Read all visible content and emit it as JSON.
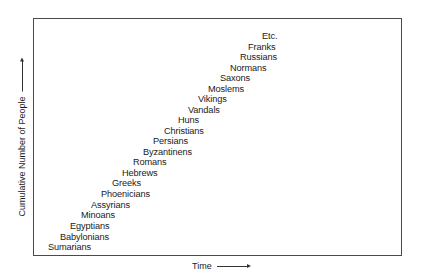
{
  "chart_data": {
    "type": "scatter",
    "title": "",
    "xlabel": "Time",
    "ylabel": "Cumulative Number of People",
    "grid": false,
    "legend": null,
    "axis_ticks": "none",
    "annotations": "Text labels arranged diagonally, each representing a people group; position rises with time",
    "points": [
      {
        "label": "Sumarians",
        "order": 1
      },
      {
        "label": "Babylonians",
        "order": 2
      },
      {
        "label": "Egyptians",
        "order": 3
      },
      {
        "label": "Minoans",
        "order": 4
      },
      {
        "label": "Assyrians",
        "order": 5
      },
      {
        "label": "Phoenicians",
        "order": 6
      },
      {
        "label": "Greeks",
        "order": 7
      },
      {
        "label": "Hebrews",
        "order": 8
      },
      {
        "label": "Romans",
        "order": 9
      },
      {
        "label": "Byzantinens",
        "order": 10
      },
      {
        "label": "Persians",
        "order": 11
      },
      {
        "label": "Christians",
        "order": 12
      },
      {
        "label": "Huns",
        "order": 13
      },
      {
        "label": "Vandals",
        "order": 14
      },
      {
        "label": "Vikings",
        "order": 15
      },
      {
        "label": "Moslems",
        "order": 16
      },
      {
        "label": "Saxons",
        "order": 17
      },
      {
        "label": "Normans",
        "order": 18
      },
      {
        "label": "Russians",
        "order": 19
      },
      {
        "label": "Franks",
        "order": 20
      },
      {
        "label": "Etc.",
        "order": 21
      }
    ]
  },
  "axes": {
    "x_label": "Time",
    "y_label": "Cumulative Number of People"
  },
  "labels": [
    {
      "text": "Sumarians",
      "x": 48,
      "y": 247
    },
    {
      "text": "Babylonians",
      "x": 60,
      "y": 237
    },
    {
      "text": "Egyptians",
      "x": 70,
      "y": 226
    },
    {
      "text": "Minoans",
      "x": 81,
      "y": 215
    },
    {
      "text": "Assyrians",
      "x": 91,
      "y": 205
    },
    {
      "text": "Phoenicians",
      "x": 101,
      "y": 194
    },
    {
      "text": "Greeks",
      "x": 112,
      "y": 183
    },
    {
      "text": "Hebrews",
      "x": 122,
      "y": 173
    },
    {
      "text": "Romans",
      "x": 133,
      "y": 162
    },
    {
      "text": "Byzantinens",
      "x": 143,
      "y": 152
    },
    {
      "text": "Persians",
      "x": 153,
      "y": 141
    },
    {
      "text": "Christians",
      "x": 164,
      "y": 131
    },
    {
      "text": "Huns",
      "x": 178,
      "y": 120
    },
    {
      "text": "Vandals",
      "x": 188,
      "y": 110
    },
    {
      "text": "Vikings",
      "x": 198,
      "y": 99
    },
    {
      "text": "Moslems",
      "x": 208,
      "y": 89
    },
    {
      "text": "Saxons",
      "x": 220,
      "y": 78
    },
    {
      "text": "Normans",
      "x": 230,
      "y": 68
    },
    {
      "text": "Russians",
      "x": 240,
      "y": 57
    },
    {
      "text": "Franks",
      "x": 248,
      "y": 47
    },
    {
      "text": "Etc.",
      "x": 262,
      "y": 36
    }
  ]
}
